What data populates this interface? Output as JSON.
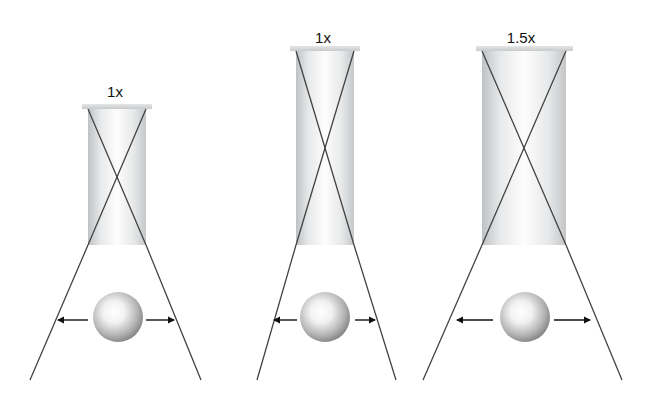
{
  "diagram": {
    "panels": [
      {
        "label": "1x",
        "label_pos": [
          115,
          84
        ],
        "cap": {
          "x": 82,
          "y": 104,
          "w": 70,
          "h": 5
        },
        "tube": {
          "x": 88,
          "y": 109,
          "w": 58,
          "h": 136
        },
        "cone": {
          "left_bottom_x": 30,
          "right_bottom_x": 201,
          "bottom_y": 380
        },
        "ball": {
          "cx": 118,
          "cy": 317,
          "r": 25
        },
        "arrows": {
          "left": [
            88,
            58
          ],
          "right": [
            146,
            174
          ],
          "y": 320
        }
      },
      {
        "label": "1x",
        "label_pos": [
          323,
          30
        ],
        "cap": {
          "x": 290,
          "y": 46,
          "w": 70,
          "h": 5
        },
        "tube": {
          "x": 296,
          "y": 51,
          "w": 58,
          "h": 194
        },
        "cone": {
          "left_bottom_x": 257,
          "right_bottom_x": 396,
          "bottom_y": 380
        },
        "ball": {
          "cx": 325,
          "cy": 317,
          "r": 25
        },
        "arrows": {
          "left": [
            297,
            274
          ],
          "right": [
            355,
            375
          ],
          "y": 320
        }
      },
      {
        "label": "1.5x",
        "label_pos": [
          521,
          30
        ],
        "cap": {
          "x": 476,
          "y": 46,
          "w": 97,
          "h": 5
        },
        "tube": {
          "x": 482,
          "y": 51,
          "w": 84,
          "h": 194
        },
        "cone": {
          "left_bottom_x": 423,
          "right_bottom_x": 622,
          "bottom_y": 380
        },
        "ball": {
          "cx": 525,
          "cy": 317,
          "r": 25
        },
        "arrows": {
          "left": [
            493,
            457
          ],
          "right": [
            554,
            590
          ],
          "y": 320
        }
      }
    ],
    "colors": {
      "line": "#444444",
      "tube_edge": "#c4c7c9",
      "tube_center": "#fbfbfb",
      "cap": "#d6d8d9",
      "ball_light": "#ffffff",
      "ball_dark": "#8c8c8c",
      "arrow": "#111111"
    }
  }
}
